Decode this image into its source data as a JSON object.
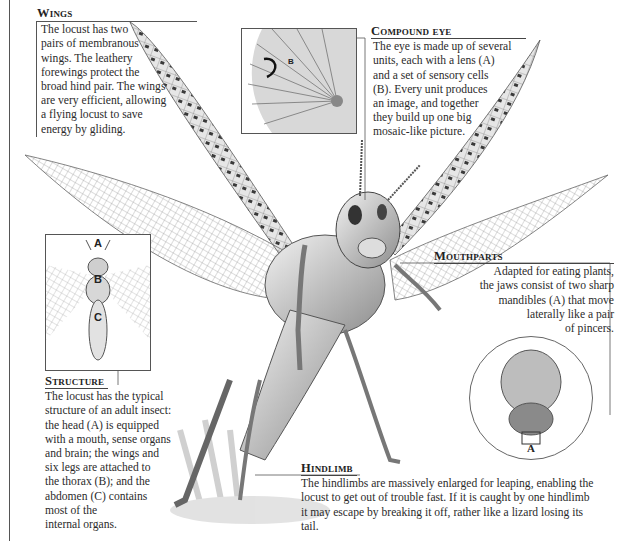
{
  "captions": {
    "wings": {
      "heading": "Wings",
      "body": "The locust has two\npairs of membranous\nwings. The leathery\nforewings protect the\nbroad hind pair. The wings\nare very efficient, allowing\na flying locust to save\nenergy by gliding."
    },
    "compound_eye": {
      "heading": "Compound eye",
      "body": "The eye is made up of several\nunits, each with a lens (A)\nand a set of sensory cells\n(B). Every unit produces\nan image, and together\nthey build up one big\nmosaic-like picture."
    },
    "mouthparts": {
      "heading": "Mouthparts",
      "body": "Adapted for eating plants,\nthe jaws consist of two sharp\nmandibles (A) that move\nlaterally like a pair\nof pincers."
    },
    "structure": {
      "heading": "Structure",
      "body": "The locust has the typical\nstructure of an adult insect:\nthe head (A) is equipped\nwith a mouth, sense organs\nand brain; the wings and\nsix legs are attached to\nthe thorax (B); and the\nabdomen (C) contains\nmost of the\ninternal organs."
    },
    "hindlimb": {
      "heading": "Hindlimb",
      "body": "The hindlimbs are massively enlarged for leaping, enabling the\nlocust to get out of trouble fast. If it is caught by one hindlimb\nit may escape by breaking it off, rather like a lizard losing its tail."
    }
  },
  "insets": {
    "compound_eye": {
      "labels": [
        "A",
        "B"
      ]
    },
    "structure": {
      "labels": [
        "A",
        "B",
        "C"
      ]
    },
    "mouthparts": {
      "labels": [
        "A"
      ]
    }
  },
  "colors": {
    "ink": "#2b2b2b",
    "rule": "#555555",
    "wing_pattern": "#3a3a3a",
    "body_shade": "#9a9a9a"
  }
}
